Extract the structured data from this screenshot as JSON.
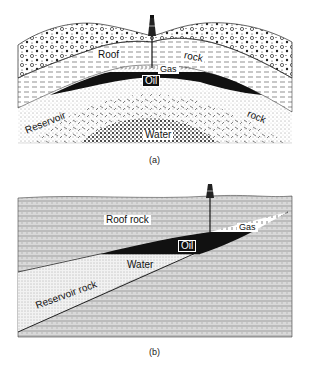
{
  "figure_a": {
    "caption": "(a)",
    "labels": {
      "roof": "Roof",
      "rock_top": "rock",
      "gas": "Gas",
      "oil": "Oil",
      "reservoir": "Reservoir",
      "rock_bottom": "rock",
      "water": "Water"
    }
  },
  "figure_b": {
    "caption": "(b)",
    "labels": {
      "roof_rock": "Roof rock",
      "gas": "Gas",
      "oil": "Oil",
      "water": "Water",
      "reservoir_rock": "Reservoir rock"
    }
  }
}
